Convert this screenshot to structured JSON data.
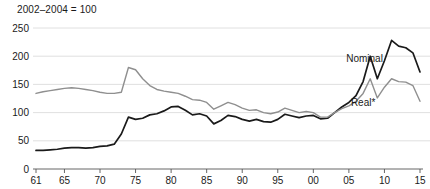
{
  "chart_data": {
    "type": "line",
    "title": "2002–2004 = 100",
    "xlabel": "",
    "ylabel": "",
    "ylim": [
      0,
      250
    ],
    "xlim": [
      1961,
      2015
    ],
    "yticks": [
      0,
      50,
      100,
      150,
      200,
      250
    ],
    "ytick_labels": [
      "0",
      "50",
      "100",
      "150",
      "200",
      "250"
    ],
    "xticks": [
      1961,
      1965,
      1970,
      1975,
      1980,
      1985,
      1990,
      1995,
      2000,
      2005,
      2010,
      2015
    ],
    "xtick_labels": [
      "61",
      "65",
      "70",
      "75",
      "80",
      "85",
      "90",
      "95",
      "00",
      "05",
      "10",
      "15"
    ],
    "grid": true,
    "legend": "inline-annotations",
    "annotations": [
      {
        "name": "nominal-label",
        "text": "Nominal",
        "x": 2007.2,
        "y": 196
      },
      {
        "name": "real-label",
        "text": "Real*",
        "x": 2007.0,
        "y": 118
      }
    ],
    "series": [
      {
        "name": "Nominal",
        "color": "#1a1a1a",
        "x": [
          1961,
          1962,
          1963,
          1964,
          1965,
          1966,
          1967,
          1968,
          1969,
          1970,
          1971,
          1972,
          1973,
          1974,
          1975,
          1976,
          1977,
          1978,
          1979,
          1980,
          1981,
          1982,
          1983,
          1984,
          1985,
          1986,
          1987,
          1988,
          1989,
          1990,
          1991,
          1992,
          1993,
          1994,
          1995,
          1996,
          1997,
          1998,
          1999,
          2000,
          2001,
          2002,
          2003,
          2004,
          2005,
          2006,
          2007,
          2008,
          2009,
          2010,
          2011,
          2012,
          2013,
          2014,
          2015
        ],
        "values": [
          33,
          33,
          34,
          35,
          37,
          38,
          38,
          37,
          38,
          40,
          41,
          44,
          62,
          92,
          88,
          90,
          96,
          98,
          103,
          110,
          111,
          104,
          96,
          98,
          94,
          80,
          86,
          95,
          93,
          88,
          85,
          88,
          84,
          83,
          88,
          97,
          94,
          91,
          94,
          95,
          89,
          90,
          100,
          110,
          118,
          130,
          155,
          200,
          160,
          192,
          228,
          218,
          215,
          206,
          172
        ],
        "linewidth": 1.7
      },
      {
        "name": "Real*",
        "color": "#8f8f8f",
        "x": [
          1961,
          1962,
          1963,
          1964,
          1965,
          1966,
          1967,
          1968,
          1969,
          1970,
          1971,
          1972,
          1973,
          1974,
          1975,
          1976,
          1977,
          1978,
          1979,
          1980,
          1981,
          1982,
          1983,
          1984,
          1985,
          1986,
          1987,
          1988,
          1989,
          1990,
          1991,
          1992,
          1993,
          1994,
          1995,
          1996,
          1997,
          1998,
          1999,
          2000,
          2001,
          2002,
          2003,
          2004,
          2005,
          2006,
          2007,
          2008,
          2009,
          2010,
          2011,
          2012,
          2013,
          2014,
          2015
        ],
        "values": [
          134,
          137,
          139,
          141,
          143,
          144,
          143,
          141,
          139,
          136,
          134,
          134,
          136,
          180,
          176,
          160,
          148,
          141,
          138,
          136,
          134,
          129,
          123,
          122,
          118,
          106,
          112,
          118,
          114,
          108,
          104,
          105,
          100,
          98,
          101,
          108,
          104,
          100,
          102,
          100,
          92,
          92,
          100,
          107,
          112,
          120,
          134,
          160,
          126,
          145,
          160,
          155,
          154,
          148,
          120
        ],
        "linewidth": 1.4
      }
    ]
  },
  "colors": {
    "nominal": "#1a1a1a",
    "real": "#8f8f8f",
    "grid": "#d8d8d8",
    "axis": "#555555",
    "text": "#1a1a1a",
    "background": "#ffffff"
  }
}
